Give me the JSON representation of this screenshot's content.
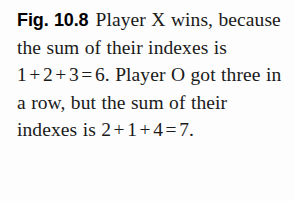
{
  "figure": {
    "label": "Fig. 10.8",
    "caption_full": "Fig. 10.8 Player X wins, because the sum of their indexes is 1 + 2 + 3 = 6. Player O got three in a row, but the sum of their indexes is 2 + 1 + 4 = 7.",
    "segments": {
      "s1": "Player X wins,",
      "s2": "because the sum of their",
      "s3": "indexes is",
      "s4": "Player O got three in a row,",
      "s5": "but the sum of their indexes is"
    },
    "equations": {
      "eq1": {
        "terms": [
          "1",
          "2",
          "3"
        ],
        "operators": [
          "+",
          "+"
        ],
        "equals": "=",
        "result": "6",
        "trailing": ".",
        "full": "1 + 2 + 3 = 6."
      },
      "eq2": {
        "terms": [
          "2",
          "1",
          "4"
        ],
        "operators": [
          "+",
          "+"
        ],
        "equals": "=",
        "result": "7",
        "trailing": ".",
        "full": "2 + 1 + 4 = 7."
      }
    },
    "lines": [
      "Fig. 10.8  Player X wins,",
      "because the sum of their",
      "indexes is 1 + 2 + 3 = 6.",
      "Player O got three in a row,",
      "but the sum of their indexes is",
      "2 + 1 + 4 = 7."
    ],
    "colors": {
      "text": "#1a1a1a",
      "label": "#000000",
      "background": "#fdfdfd"
    }
  }
}
